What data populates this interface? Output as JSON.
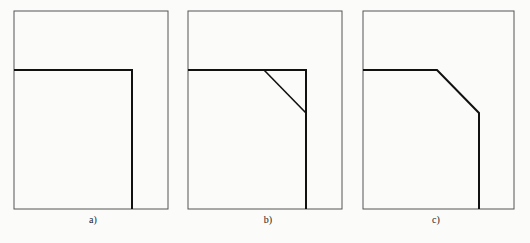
{
  "figure": {
    "panels": [
      {
        "id": "a",
        "label": "a)",
        "frame": {
          "x": 14,
          "y": 11,
          "w": 154,
          "h": 198
        },
        "profile": [
          [
            14,
            70
          ],
          [
            132,
            70
          ],
          [
            132,
            209
          ]
        ],
        "label_pos": {
          "x": 93,
          "y": 214
        }
      },
      {
        "id": "b",
        "label": "b)",
        "frame": {
          "x": 188,
          "y": 11,
          "w": 154,
          "h": 198
        },
        "profile": [
          [
            188,
            70
          ],
          [
            306,
            70
          ],
          [
            306,
            209
          ]
        ],
        "chamfer": [
          [
            264,
            70
          ],
          [
            306,
            113
          ]
        ],
        "label_pos": {
          "x": 268,
          "y": 214
        }
      },
      {
        "id": "c",
        "label": "c)",
        "frame": {
          "x": 363,
          "y": 11,
          "w": 151,
          "h": 198
        },
        "profile": [
          [
            363,
            70
          ],
          [
            437,
            70
          ],
          [
            479,
            113
          ],
          [
            479,
            209
          ]
        ],
        "label_pos": {
          "x": 436,
          "y": 214
        }
      }
    ],
    "colors": {
      "frame": "#555555",
      "profile": "#111111",
      "background": "#fbfbfa"
    }
  }
}
